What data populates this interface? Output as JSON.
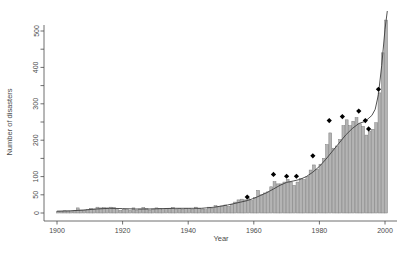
{
  "figure": {
    "background": "#ffffff"
  },
  "chart_data": {
    "type": "bar",
    "title": "",
    "xlabel": "Year",
    "ylabel": "Number of disasters",
    "xlim": [
      1896,
      2004
    ],
    "ylim": [
      0,
      560
    ],
    "grid": false,
    "legend": "none",
    "x_ticks_labeled": [
      1900,
      1920,
      1940,
      1960,
      1980,
      2000
    ],
    "y_ticks_all": [
      0,
      50,
      100,
      150,
      200,
      250,
      300,
      350,
      400,
      450,
      500
    ],
    "y_ticks_labeled": [
      0,
      50,
      100,
      200,
      300,
      400,
      500
    ],
    "bar_fill": "#b4b4b4",
    "bar_border": "#7e7e7e",
    "line_color": "#3d3d3d",
    "marker_color": "#000000",
    "axis_color": "#4a4a4a",
    "categories": [
      1900,
      1901,
      1902,
      1903,
      1904,
      1905,
      1906,
      1907,
      1908,
      1909,
      1910,
      1911,
      1912,
      1913,
      1914,
      1915,
      1916,
      1917,
      1918,
      1919,
      1920,
      1921,
      1922,
      1923,
      1924,
      1925,
      1926,
      1927,
      1928,
      1929,
      1930,
      1931,
      1932,
      1933,
      1934,
      1935,
      1936,
      1937,
      1938,
      1939,
      1940,
      1941,
      1942,
      1943,
      1944,
      1945,
      1946,
      1947,
      1948,
      1949,
      1950,
      1951,
      1952,
      1953,
      1954,
      1955,
      1956,
      1957,
      1958,
      1959,
      1960,
      1961,
      1962,
      1963,
      1964,
      1965,
      1966,
      1967,
      1968,
      1969,
      1970,
      1971,
      1972,
      1973,
      1974,
      1975,
      1976,
      1977,
      1978,
      1979,
      1980,
      1981,
      1982,
      1983,
      1984,
      1985,
      1986,
      1987,
      1988,
      1989,
      1990,
      1991,
      1992,
      1993,
      1994,
      1995,
      1996,
      1997,
      1998,
      1999,
      2000
    ],
    "values": [
      5,
      4,
      6,
      5,
      4,
      6,
      14,
      8,
      8,
      9,
      13,
      11,
      16,
      14,
      15,
      14,
      16,
      15,
      9,
      7,
      10,
      9,
      7,
      14,
      8,
      11,
      15,
      12,
      8,
      11,
      14,
      12,
      9,
      12,
      13,
      15,
      11,
      12,
      10,
      13,
      12,
      10,
      16,
      13,
      11,
      9,
      16,
      13,
      20,
      17,
      19,
      22,
      18,
      24,
      30,
      36,
      38,
      36,
      40,
      34,
      42,
      62,
      50,
      55,
      58,
      72,
      86,
      80,
      80,
      85,
      92,
      85,
      76,
      85,
      95,
      92,
      100,
      118,
      132,
      120,
      134,
      150,
      188,
      220,
      178,
      184,
      202,
      240,
      256,
      240,
      252,
      262,
      245,
      238,
      214,
      225,
      230,
      248,
      330,
      440,
      530
    ],
    "trend_line": {
      "name": "smoothed trend",
      "x": [
        1900,
        1904,
        1908,
        1912,
        1916,
        1920,
        1924,
        1928,
        1932,
        1936,
        1940,
        1944,
        1948,
        1952,
        1956,
        1958,
        1960,
        1962,
        1964,
        1966,
        1968,
        1970,
        1972,
        1974,
        1976,
        1978,
        1980,
        1982,
        1984,
        1986,
        1988,
        1990,
        1992,
        1994,
        1996,
        1997,
        1998,
        1999,
        2000,
        2000.7
      ],
      "y": [
        5,
        6,
        8,
        11,
        13,
        12,
        11,
        11,
        12,
        13,
        13,
        13,
        16,
        22,
        30,
        34,
        40,
        48,
        56,
        66,
        76,
        84,
        88,
        92,
        100,
        112,
        128,
        148,
        170,
        192,
        214,
        232,
        246,
        252,
        268,
        285,
        325,
        405,
        505,
        555
      ]
    },
    "markers": {
      "name": "el-nino-year markers",
      "symbol": "diamond",
      "points": [
        {
          "x": 1958,
          "y": 44
        },
        {
          "x": 1966,
          "y": 106
        },
        {
          "x": 1970,
          "y": 101
        },
        {
          "x": 1973,
          "y": 101
        },
        {
          "x": 1978,
          "y": 157
        },
        {
          "x": 1983,
          "y": 254
        },
        {
          "x": 1987,
          "y": 265
        },
        {
          "x": 1992,
          "y": 280
        },
        {
          "x": 1994,
          "y": 254
        },
        {
          "x": 1995,
          "y": 231
        },
        {
          "x": 1998,
          "y": 340
        }
      ]
    }
  }
}
